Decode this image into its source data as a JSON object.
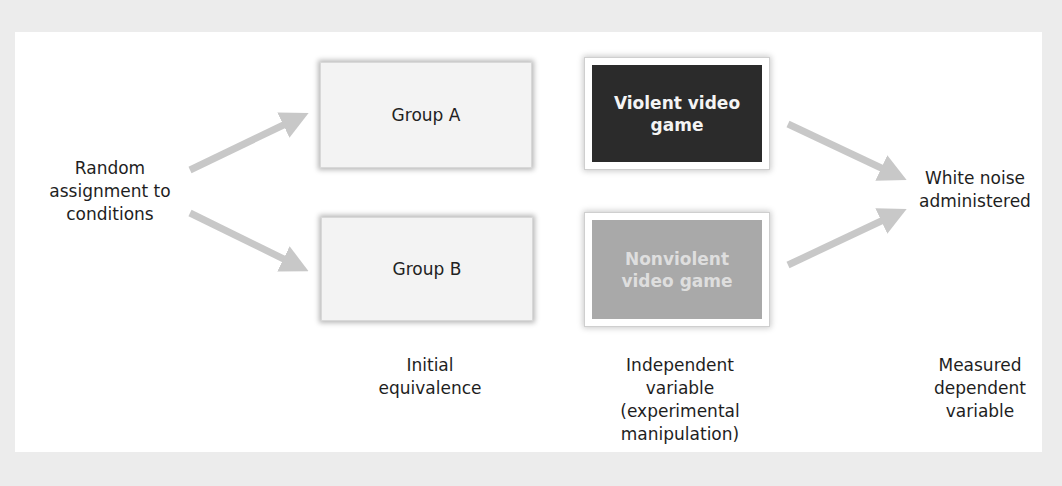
{
  "diagram": {
    "type": "experimental-design-flow",
    "start_label": "Random\nassignment to\nconditions",
    "groups": [
      {
        "label": "Group A"
      },
      {
        "label": "Group B"
      }
    ],
    "conditions": [
      {
        "label": "Violent video\ngame",
        "style": "dark"
      },
      {
        "label": "Nonviolent\nvideo game",
        "style": "mid"
      }
    ],
    "outcome_label": "White noise\nadministered",
    "column_captions": {
      "groups": "Initial\nequivalence",
      "conditions": "Independent\nvariable\n(experimental\nmanipulation)",
      "outcome": "Measured\ndependent\nvariable"
    },
    "colors": {
      "background": "#ececec",
      "panel": "#ffffff",
      "arrow": "#c8c8c8",
      "violent_box": "#2b2b2b",
      "nonviolent_box": "#a9a9a9",
      "group_box": "#f3f3f3"
    }
  }
}
